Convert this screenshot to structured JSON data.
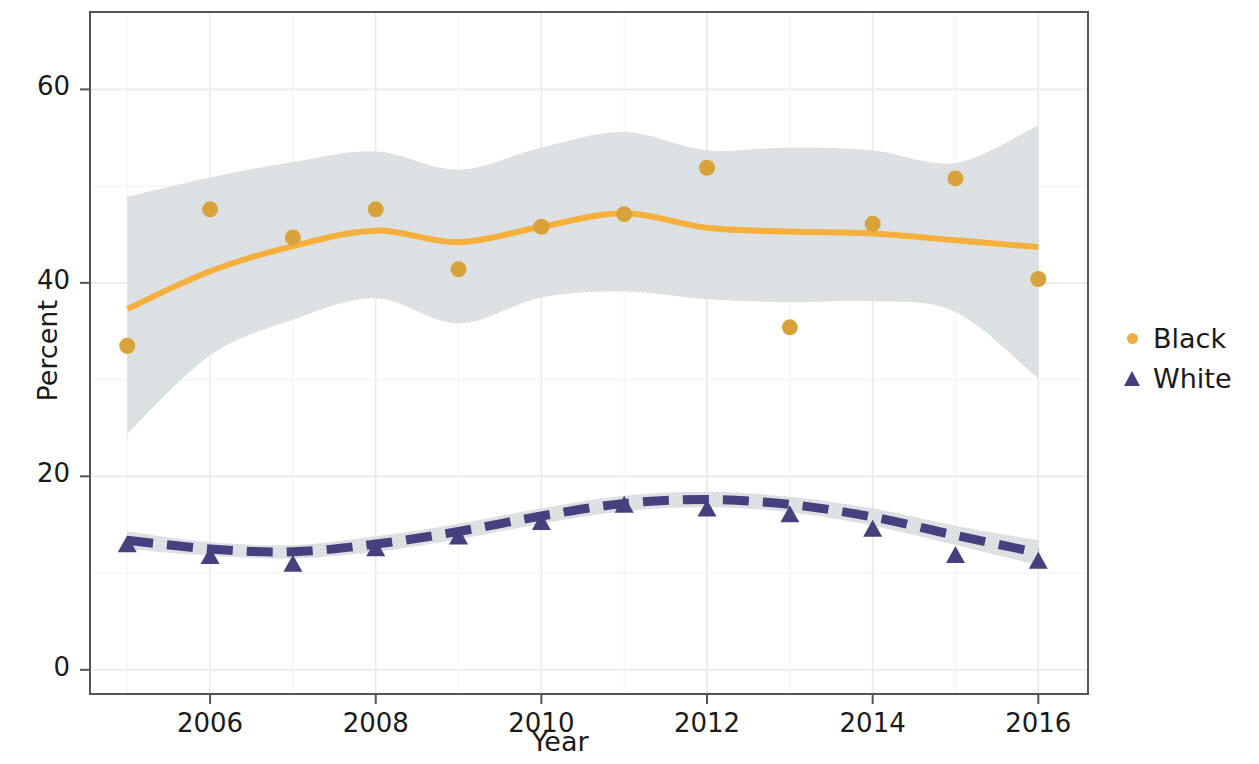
{
  "chart_data": {
    "type": "line",
    "title": "",
    "xlabel": "Year",
    "ylabel": "Percent",
    "xlim": [
      2004.55,
      2016.6
    ],
    "ylim": [
      -2.5,
      68
    ],
    "xticks": [
      2006,
      2008,
      2010,
      2012,
      2014,
      2016
    ],
    "xtick_labels": [
      "2006",
      "2008",
      "2010",
      "2012",
      "2014",
      "2016"
    ],
    "yticks": [
      0,
      20,
      40,
      60
    ],
    "ytick_labels": [
      "0",
      "20",
      "40",
      "60"
    ],
    "grid": true,
    "legend_position": "right",
    "x": [
      2005,
      2006,
      2007,
      2008,
      2009,
      2010,
      2011,
      2012,
      2013,
      2014,
      2015,
      2016
    ],
    "series": [
      {
        "name": "Black",
        "marker": "circle",
        "color": "#F5AF3C",
        "point_color": "#D9A13A",
        "band_color": "#D3D8DB",
        "linestyle": "solid",
        "values": [
          33.5,
          47.6,
          44.7,
          47.6,
          41.4,
          45.8,
          47.1,
          51.9,
          35.4,
          46.1,
          50.8,
          40.4
        ],
        "smooth_fit": [
          37.3,
          41.2,
          43.8,
          45.4,
          44.2,
          45.8,
          47.2,
          45.7,
          45.3,
          45.1,
          44.4,
          43.7
        ],
        "band_upper": [
          48.9,
          50.9,
          52.5,
          53.6,
          51.7,
          54.0,
          55.6,
          53.7,
          54.0,
          53.7,
          52.4,
          56.3
        ],
        "band_lower": [
          24.4,
          32.5,
          36.2,
          38.4,
          35.8,
          38.5,
          39.1,
          38.3,
          38.0,
          38.1,
          37.0,
          30.1
        ]
      },
      {
        "name": "White",
        "marker": "triangle",
        "color": "#45417E",
        "point_color": "#45417E",
        "band_color": "#D8DCDF",
        "linestyle": "dashed",
        "values": [
          13.9,
          12.7,
          11.9,
          13.5,
          14.7,
          16.2,
          18.0,
          17.6,
          17.0,
          15.5,
          12.8,
          12.2
        ],
        "smooth_fit": [
          13.4,
          12.5,
          12.2,
          13.0,
          14.3,
          15.9,
          17.2,
          17.6,
          17.1,
          15.8,
          13.9,
          12.1
        ],
        "band_upper": [
          14.3,
          13.2,
          12.9,
          13.8,
          15.1,
          16.7,
          18.0,
          18.4,
          17.9,
          16.7,
          14.9,
          13.4
        ],
        "band_lower": [
          12.5,
          11.8,
          11.5,
          12.2,
          13.5,
          15.1,
          16.4,
          16.8,
          16.3,
          14.9,
          12.9,
          10.8
        ]
      }
    ]
  },
  "legend": {
    "items": [
      {
        "label": "Black",
        "marker": "circle",
        "color": "#F0AE42"
      },
      {
        "label": "White",
        "marker": "triangle",
        "color": "#45417E"
      }
    ]
  },
  "colors": {
    "black_series": "#F5AF3C",
    "white_series": "#45417E",
    "confidence_band": "#D3D8DB",
    "panel_border": "#555555",
    "gridline": "#EAEAEA",
    "text": "#1a1a1a"
  }
}
